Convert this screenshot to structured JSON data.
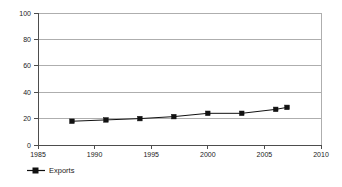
{
  "chart_data": {
    "type": "line",
    "title": "",
    "subtitle": "",
    "xlabel": "",
    "ylabel": "",
    "xlim": [
      1985,
      2010
    ],
    "ylim": [
      0,
      100
    ],
    "grid": true,
    "grid_axis": "y",
    "legend_position": "bottom-left",
    "x_ticks": [
      1985,
      1990,
      1995,
      2000,
      2005,
      2010
    ],
    "x_tick_labels": [
      "1985",
      "1990",
      "1995",
      "2000",
      "2005",
      "2010"
    ],
    "y_ticks": [
      0,
      20,
      40,
      60,
      80,
      100
    ],
    "y_tick_labels": [
      "0",
      "20",
      "40",
      "60",
      "80",
      "100"
    ],
    "series": [
      {
        "name": "Exports",
        "marker": "square",
        "color": "#111111",
        "x": [
          1988,
          1991,
          1994,
          1997,
          2000,
          2003,
          2006,
          2007
        ],
        "values": [
          18,
          19,
          20,
          21.5,
          24,
          24,
          27,
          28.5
        ]
      }
    ],
    "legend": [
      {
        "label": "Exports",
        "color": "#111111",
        "marker": "square"
      }
    ]
  },
  "colors": {
    "background": "#ffffff",
    "gridline": "#8c8c8c",
    "axis": "#4d4d4d",
    "series": "#111111",
    "text": "#1a1a1a"
  }
}
